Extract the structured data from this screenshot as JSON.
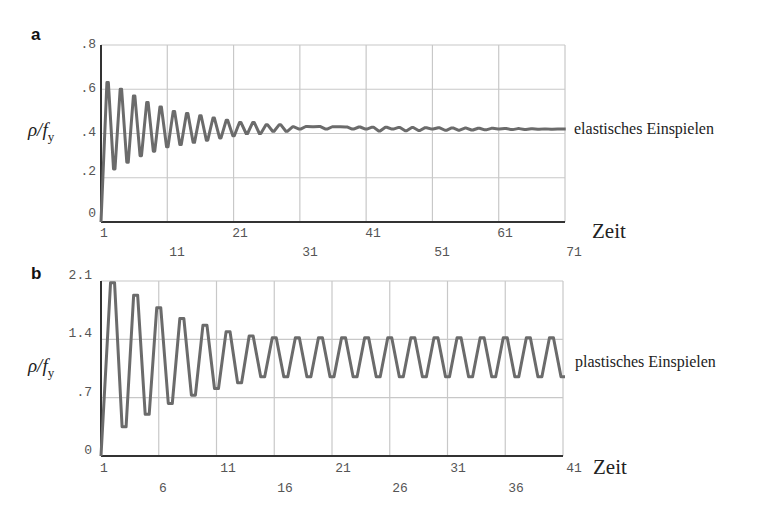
{
  "chart_data": [
    {
      "type": "line",
      "panel": "a",
      "title": "",
      "xlabel": "Zeit",
      "ylabel": "ρ/f_y",
      "xlim": [
        1,
        71
      ],
      "ylim": [
        0,
        0.8
      ],
      "grid": true,
      "x_ticks_row1": [
        "1",
        "21",
        "41",
        "61"
      ],
      "x_ticks_row2": [
        "11",
        "31",
        "51",
        "71"
      ],
      "y_ticks": [
        "0",
        ".2",
        ".4",
        ".6",
        ".8"
      ],
      "annotation": "elastisches Einspielen",
      "series": [
        {
          "name": "ρ/f_y",
          "description": "damped oscillation converging to ~0.42 (shakedown)",
          "x": [
            1,
            2,
            3,
            4,
            5,
            6,
            7,
            8,
            9,
            10,
            11,
            12,
            13,
            14,
            15,
            16,
            17,
            18,
            19,
            20,
            21,
            22,
            23,
            24,
            25,
            26,
            27,
            28,
            29,
            30,
            31,
            33,
            35,
            37,
            39,
            41,
            45,
            51,
            61,
            71
          ],
          "values": [
            0.0,
            0.63,
            0.24,
            0.6,
            0.27,
            0.57,
            0.3,
            0.54,
            0.32,
            0.52,
            0.34,
            0.5,
            0.35,
            0.49,
            0.36,
            0.48,
            0.37,
            0.47,
            0.38,
            0.46,
            0.39,
            0.45,
            0.4,
            0.45,
            0.4,
            0.44,
            0.41,
            0.44,
            0.41,
            0.43,
            0.42,
            0.43,
            0.42,
            0.43,
            0.42,
            0.42,
            0.42,
            0.42,
            0.42,
            0.42
          ]
        }
      ]
    },
    {
      "type": "line",
      "panel": "b",
      "title": "",
      "xlabel": "Zeit",
      "ylabel": "ρ/f_y",
      "xlim": [
        1,
        41
      ],
      "ylim": [
        0,
        2.1
      ],
      "grid": true,
      "x_ticks_row1": [
        "1",
        "11",
        "21",
        "31",
        "41"
      ],
      "x_ticks_row2": [
        "6",
        "16",
        "26",
        "36"
      ],
      "y_ticks": [
        "0",
        ".7",
        "1.4",
        "2.1"
      ],
      "annotation": "plastisches Einspielen",
      "series": [
        {
          "name": "ρ/f_y",
          "description": "oscillation settling into steady alternating cycle between ~0.95 and ~1.42",
          "x": [
            1,
            2,
            3,
            4,
            5,
            6,
            7,
            8,
            9,
            10,
            11,
            12,
            13,
            14,
            15,
            16,
            17,
            18,
            19,
            20,
            21,
            22,
            23,
            24,
            25,
            26,
            27,
            28,
            29,
            30,
            31,
            32,
            33,
            34,
            35,
            36,
            37,
            38,
            39,
            40,
            41
          ],
          "values": [
            0.0,
            2.08,
            0.35,
            1.93,
            0.5,
            1.78,
            0.63,
            1.65,
            0.73,
            1.57,
            0.81,
            1.49,
            0.88,
            1.44,
            0.95,
            1.42,
            0.95,
            1.42,
            0.95,
            1.42,
            0.95,
            1.42,
            0.95,
            1.42,
            0.95,
            1.42,
            0.95,
            1.42,
            0.95,
            1.42,
            0.95,
            1.42,
            0.95,
            1.42,
            0.95,
            1.42,
            0.95,
            1.42,
            0.95,
            1.42,
            0.95
          ]
        }
      ]
    }
  ],
  "panels": {
    "a": {
      "letter": "a",
      "ylabel_main": "ρ/f",
      "ylabel_sub": "y",
      "xlabel": "Zeit",
      "annotation": "elastisches Einspielen",
      "y_ticks": [
        ".8",
        ".6",
        ".4",
        ".2",
        "0"
      ],
      "x_ticks_row1": [
        "1",
        "21",
        "41",
        "61"
      ],
      "x_ticks_row2": [
        "11",
        "31",
        "51",
        "71"
      ]
    },
    "b": {
      "letter": "b",
      "ylabel_main": "ρ/f",
      "ylabel_sub": "y",
      "xlabel": "Zeit",
      "annotation": "plastisches Einspielen",
      "y_ticks": [
        "2.1",
        "1.4",
        ".7",
        "0"
      ],
      "x_ticks_row1": [
        "1",
        "11",
        "21",
        "31",
        "41"
      ],
      "x_ticks_row2": [
        "6",
        "16",
        "26",
        "36"
      ]
    }
  },
  "colors": {
    "line": "#6b6b6b",
    "grid": "#c8c8c8",
    "axis": "#333333"
  }
}
